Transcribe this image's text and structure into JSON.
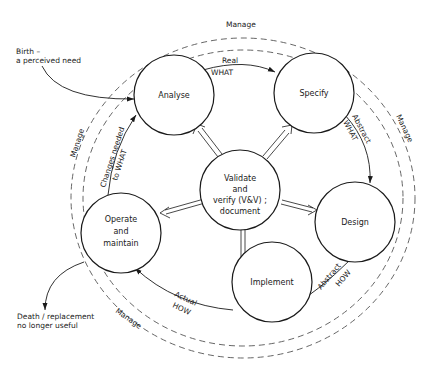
{
  "diagram": {
    "type": "software-lifecycle-cycle",
    "nodes": [
      {
        "id": "analyse",
        "label": [
          "Analyse"
        ]
      },
      {
        "id": "specify",
        "label": [
          "Specify"
        ]
      },
      {
        "id": "design",
        "label": [
          "Design"
        ]
      },
      {
        "id": "implement",
        "label": [
          "Implement"
        ]
      },
      {
        "id": "operate",
        "label": [
          "Operate",
          "and",
          "maintain"
        ]
      },
      {
        "id": "validate",
        "label": [
          "Validate",
          "and",
          "verify (V&V) ;",
          "document"
        ]
      }
    ],
    "edges": [
      {
        "from": "analyse",
        "to": "specify",
        "label": [
          "Real",
          "WHAT"
        ]
      },
      {
        "from": "specify",
        "to": "design",
        "label": [
          "Abstract",
          "WHAT"
        ]
      },
      {
        "from": "design",
        "to": "implement",
        "label": [
          "Abstract",
          "HOW"
        ]
      },
      {
        "from": "implement",
        "to": "operate",
        "label": [
          "Actual",
          "HOW"
        ]
      },
      {
        "from": "operate",
        "to": "analyse",
        "label": [
          "Changes needed",
          "to WHAT"
        ]
      },
      {
        "from": "validate",
        "to": "analyse",
        "style": "double-arrow"
      },
      {
        "from": "validate",
        "to": "specify",
        "style": "double-arrow"
      },
      {
        "from": "validate",
        "to": "design",
        "style": "double-arrow"
      },
      {
        "from": "validate",
        "to": "implement",
        "style": "double-arrow"
      },
      {
        "from": "validate",
        "to": "operate",
        "style": "double-arrow"
      }
    ],
    "ring": {
      "label": "Manage",
      "style": "dashed-double"
    },
    "ring_labels": [
      "Manage",
      "Manage",
      "Manage",
      "Manage"
    ],
    "external": {
      "birth": {
        "line1": "Birth –",
        "line2": "a perceived need"
      },
      "death": {
        "line1": "Death / replacement",
        "line2": "no longer useful"
      }
    }
  },
  "colors": {
    "stroke": "#1a1a1a",
    "dash": "#555555",
    "background": "#ffffff"
  }
}
